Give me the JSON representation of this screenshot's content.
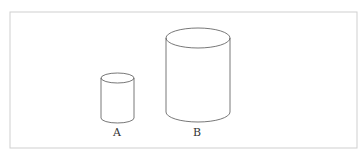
{
  "diagram": {
    "frame": {
      "x": 10,
      "y": 12,
      "width": 347,
      "height": 136,
      "stroke": "#cfcfcf"
    },
    "stroke_color": "#555555",
    "cylinders": [
      {
        "id": "A",
        "label": "A",
        "cx": 117.5,
        "rx": 16.5,
        "top_y": 78,
        "bottom_y": 118,
        "ry": 5,
        "label_x": 117,
        "label_y": 136
      },
      {
        "id": "B",
        "label": "B",
        "cx": 198,
        "rx": 32,
        "top_y": 38,
        "bottom_y": 112,
        "ry": 10,
        "label_x": 197,
        "label_y": 136
      }
    ]
  }
}
